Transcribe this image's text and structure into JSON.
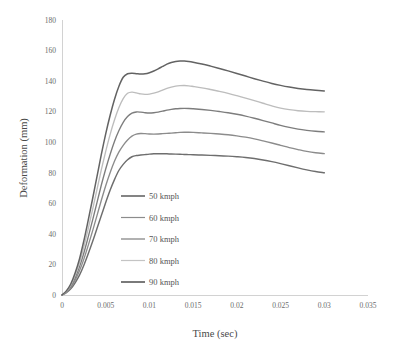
{
  "chart_data": {
    "type": "line",
    "title": "",
    "xlabel": "Time (sec)",
    "ylabel": "Deformation (mm)",
    "xlim": [
      0,
      0.035
    ],
    "ylim": [
      0,
      180
    ],
    "xticks": [
      "0",
      "0.005",
      "0.01",
      "0.015",
      "0.02",
      "0.025",
      "0.03",
      "0.035"
    ],
    "xtick_values": [
      0,
      0.005,
      0.01,
      0.015,
      0.02,
      0.025,
      0.03,
      0.035
    ],
    "yticks": [
      "0",
      "20",
      "40",
      "60",
      "80",
      "100",
      "120",
      "140",
      "160",
      "180"
    ],
    "ytick_values": [
      0,
      20,
      40,
      60,
      80,
      100,
      120,
      140,
      160,
      180
    ],
    "grid": false,
    "legend_position": "inside-left-lower",
    "x": [
      0,
      0.0005,
      0.001,
      0.0015,
      0.002,
      0.0025,
      0.003,
      0.0035,
      0.004,
      0.0045,
      0.005,
      0.0055,
      0.006,
      0.0065,
      0.007,
      0.0075,
      0.008,
      0.0085,
      0.009,
      0.0095,
      0.01,
      0.0105,
      0.011,
      0.0115,
      0.012,
      0.0125,
      0.013,
      0.0135,
      0.014,
      0.0145,
      0.015,
      0.016,
      0.017,
      0.018,
      0.019,
      0.02,
      0.021,
      0.022,
      0.023,
      0.024,
      0.025,
      0.026,
      0.027,
      0.028,
      0.029,
      0.03
    ],
    "series": [
      {
        "name": "50 kmph",
        "color": "#6e6e6e",
        "width": 1.45,
        "values": [
          0,
          1.5,
          4,
          8,
          13,
          19.5,
          27,
          35,
          43.5,
          52,
          60.5,
          68.5,
          75.5,
          81.5,
          85.5,
          88.5,
          90.5,
          91.3,
          91.6,
          91.9,
          92.2,
          92.4,
          92.5,
          92.5,
          92.4,
          92.3,
          92.2,
          92.1,
          92,
          91.9,
          91.8,
          91.6,
          91.4,
          91.2,
          90.9,
          90.5,
          90,
          89.3,
          88.4,
          87.3,
          86,
          84.6,
          83.2,
          81.9,
          80.8,
          80
        ]
      },
      {
        "name": "60 kmph",
        "color": "#8c8c8c",
        "width": 1.35,
        "values": [
          0,
          1.8,
          4.8,
          9.6,
          15.8,
          23.5,
          32.5,
          42,
          52,
          62,
          71.5,
          80,
          87.5,
          93.5,
          98,
          101.5,
          104,
          105.3,
          105.7,
          105.6,
          105.4,
          105.3,
          105.4,
          105.6,
          105.8,
          106,
          106.2,
          106.4,
          106.5,
          106.5,
          106.4,
          106.1,
          105.8,
          105.4,
          104.9,
          104.2,
          103.3,
          102.2,
          100.9,
          99.5,
          98,
          96.5,
          95.2,
          94,
          93.1,
          92.5
        ]
      },
      {
        "name": "70 kmph",
        "color": "#7d7d7d",
        "width": 1.35,
        "values": [
          0,
          2.1,
          5.6,
          11.2,
          18.4,
          27.5,
          38,
          49,
          60.5,
          72,
          82.5,
          92,
          100.5,
          107.5,
          113,
          116.8,
          119,
          119.8,
          119.7,
          119.3,
          119.1,
          119.3,
          119.7,
          120.3,
          121,
          121.5,
          121.9,
          122.1,
          122.2,
          122.1,
          121.9,
          121.4,
          120.8,
          120.1,
          119.3,
          118.3,
          117.1,
          115.7,
          114.2,
          112.6,
          111,
          109.7,
          108.6,
          107.8,
          107.2,
          106.8
        ]
      },
      {
        "name": "80 kmph",
        "color": "#bdbdbd",
        "width": 1.35,
        "values": [
          0,
          2.4,
          6.4,
          12.8,
          21,
          31.5,
          43.5,
          56,
          69,
          82,
          94,
          105,
          114.5,
          122.5,
          128.5,
          132,
          132.8,
          132.3,
          131.6,
          131.3,
          131.5,
          132.1,
          133,
          134.1,
          135.2,
          136.1,
          136.7,
          137,
          137.1,
          136.9,
          136.5,
          135.6,
          134.5,
          133.3,
          132,
          130.5,
          128.9,
          127.2,
          125.5,
          123.8,
          122.3,
          121.3,
          120.6,
          120.2,
          120,
          119.9
        ]
      },
      {
        "name": "90 kmph",
        "color": "#636363",
        "width": 1.5,
        "values": [
          0,
          2.7,
          7.2,
          14.4,
          23.6,
          35.5,
          49,
          63,
          77.5,
          92,
          105.5,
          117.5,
          128,
          136.5,
          142.5,
          144.8,
          145.2,
          144.9,
          144.6,
          144.8,
          145.5,
          146.6,
          148,
          149.6,
          151.1,
          152.2,
          152.9,
          153.2,
          153.2,
          152.9,
          152.4,
          151.2,
          149.8,
          148.3,
          146.7,
          145,
          143.3,
          141.6,
          140,
          138.5,
          137.2,
          136.1,
          135.2,
          134.5,
          134,
          133.6
        ]
      }
    ]
  },
  "legend": {
    "items": [
      {
        "label": "50 kmph",
        "color": "#6e6e6e"
      },
      {
        "label": "60 kmph",
        "color": "#8c8c8c"
      },
      {
        "label": "70 kmph",
        "color": "#7d7d7d"
      },
      {
        "label": "80 kmph",
        "color": "#c4c4c4"
      },
      {
        "label": "90 kmph",
        "color": "#636363"
      }
    ]
  },
  "axes": {
    "x_title": "Time (sec)",
    "y_title": "Deformation (mm)",
    "axis_color": "#d2d2d2"
  }
}
